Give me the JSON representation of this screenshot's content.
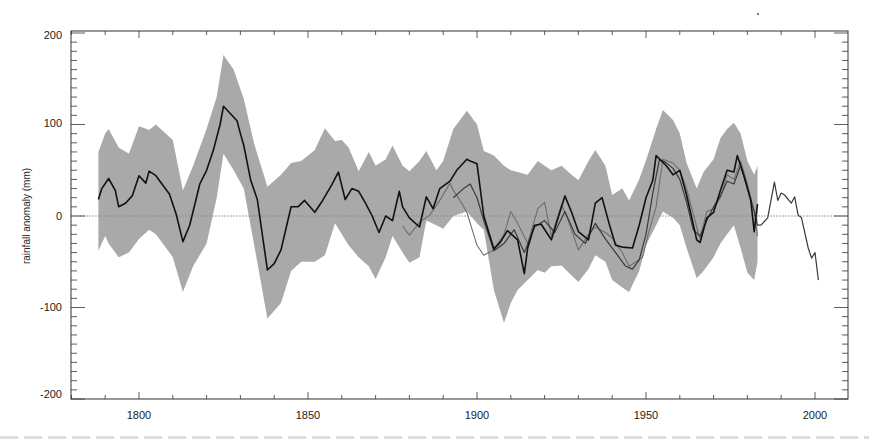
{
  "chart_data": {
    "type": "line",
    "title": "",
    "xlabel": "",
    "ylabel": "rainfall anomaly (mm)",
    "xlim": [
      1780,
      2010
    ],
    "ylim": [
      -200,
      200
    ],
    "x_ticks": [
      1800,
      1850,
      1900,
      1950,
      2000
    ],
    "y_ticks": [
      -200,
      -100,
      0,
      100,
      200
    ],
    "x_minor_step": 10,
    "y_minor_step": 10,
    "grid": false,
    "zero_line": true,
    "legend": null,
    "band": {
      "name": "uncertainty range",
      "color": "#a9a9a9",
      "x": [
        1788,
        1790,
        1791,
        1794,
        1797,
        1800,
        1803,
        1805,
        1810,
        1813,
        1816,
        1820,
        1823,
        1825,
        1828,
        1831,
        1834,
        1838,
        1842,
        1845,
        1848,
        1852,
        1855,
        1858,
        1860,
        1862,
        1865,
        1868,
        1870,
        1873,
        1875,
        1878,
        1880,
        1883,
        1885,
        1888,
        1890,
        1893,
        1897,
        1900,
        1902,
        1905,
        1908,
        1910,
        1912,
        1915,
        1918,
        1920,
        1922,
        1925,
        1928,
        1930,
        1933,
        1935,
        1938,
        1940,
        1943,
        1945,
        1948,
        1950,
        1953,
        1955,
        1958,
        1960,
        1962,
        1965,
        1967,
        1970,
        1972,
        1974,
        1976,
        1978,
        1980,
        1982,
        1983
      ],
      "upper": [
        70,
        90,
        95,
        75,
        68,
        98,
        94,
        100,
        83,
        28,
        55,
        95,
        130,
        176,
        160,
        128,
        80,
        32,
        45,
        58,
        60,
        72,
        96,
        82,
        83,
        75,
        49,
        70,
        55,
        62,
        77,
        55,
        49,
        60,
        71,
        50,
        60,
        95,
        115,
        100,
        71,
        66,
        55,
        50,
        48,
        45,
        60,
        55,
        50,
        55,
        45,
        39,
        60,
        72,
        55,
        23,
        30,
        17,
        40,
        61,
        95,
        116,
        105,
        90,
        58,
        30,
        48,
        62,
        85,
        95,
        102,
        90,
        60,
        45,
        55
      ],
      "lower": [
        -38,
        -22,
        -30,
        -45,
        -40,
        -25,
        -15,
        -20,
        -45,
        -83,
        -55,
        -30,
        20,
        68,
        50,
        30,
        -30,
        -112,
        -95,
        -60,
        -50,
        -50,
        -43,
        -8,
        -20,
        -32,
        -45,
        -55,
        -69,
        -45,
        -22,
        -40,
        -51,
        -45,
        -5,
        -10,
        -14,
        0,
        5,
        -8,
        -15,
        -81,
        -117,
        -95,
        -81,
        -70,
        -59,
        -62,
        -55,
        -54,
        -65,
        -72,
        -58,
        -43,
        -50,
        -70,
        -78,
        -83,
        -60,
        -32,
        -10,
        5,
        -2,
        -10,
        -35,
        -68,
        -60,
        -45,
        -30,
        -20,
        -10,
        -35,
        -62,
        -70,
        -50
      ]
    },
    "series": [
      {
        "name": "reconstruction",
        "color": "#111111",
        "width": 1.6,
        "x": [
          1788,
          1789,
          1791,
          1793,
          1794,
          1796,
          1798,
          1800,
          1802,
          1803,
          1805,
          1807,
          1809,
          1811,
          1813,
          1815,
          1818,
          1820,
          1822,
          1824,
          1825,
          1827,
          1829,
          1830,
          1831,
          1833,
          1835,
          1838,
          1840,
          1842,
          1845,
          1847,
          1849,
          1852,
          1854,
          1857,
          1859,
          1861,
          1863,
          1865,
          1867,
          1869,
          1871,
          1873,
          1875,
          1877,
          1878,
          1880,
          1883,
          1885,
          1887,
          1889,
          1892,
          1894,
          1897,
          1898,
          1900,
          1902,
          1905,
          1907,
          1909,
          1912,
          1914,
          1915,
          1917,
          1919,
          1922,
          1924,
          1926,
          1928,
          1930,
          1933,
          1935,
          1937,
          1939,
          1941,
          1943,
          1946,
          1948,
          1950,
          1952,
          1953,
          1956,
          1958,
          1960,
          1962,
          1965,
          1966,
          1968,
          1970,
          1972,
          1974,
          1976,
          1977,
          1979,
          1981,
          1982,
          1983
        ],
        "y": [
          18,
          30,
          41,
          28,
          10,
          14,
          22,
          44,
          36,
          49,
          44,
          34,
          24,
          2,
          -28,
          -10,
          35,
          50,
          72,
          100,
          120,
          112,
          104,
          90,
          77,
          40,
          18,
          -59,
          -52,
          -37,
          10,
          10,
          17,
          4,
          15,
          34,
          48,
          18,
          30,
          27,
          14,
          0,
          -18,
          0,
          -5,
          27,
          10,
          -2,
          -12,
          21,
          8,
          30,
          38,
          50,
          62,
          60,
          57,
          0,
          -36,
          -28,
          -16,
          -26,
          -63,
          -35,
          -10,
          -9,
          -26,
          -2,
          22,
          4,
          -17,
          -26,
          14,
          20,
          -7,
          -32,
          -34,
          -35,
          -10,
          20,
          39,
          66,
          55,
          45,
          50,
          23,
          -26,
          -29,
          -2,
          4,
          28,
          50,
          48,
          66,
          44,
          17,
          -17,
          13
        ]
      },
      {
        "name": "series 2",
        "color": "#6e6e6e",
        "width": 1.1,
        "x": [
          1878,
          1880,
          1883,
          1886,
          1889,
          1892,
          1893,
          1895,
          1897,
          1900,
          1902,
          1905,
          1908,
          1910,
          1912,
          1915,
          1918,
          1920,
          1922,
          1925,
          1927,
          1930,
          1933,
          1935,
          1938,
          1940,
          1943,
          1945,
          1947,
          1949,
          1951,
          1953,
          1955,
          1958,
          1960,
          1962,
          1965,
          1966,
          1968,
          1970,
          1972,
          1974,
          1976,
          1978,
          1980,
          1982,
          1983
        ],
        "y": [
          -11,
          -21,
          -7,
          1,
          17,
          36,
          28,
          17,
          4,
          -32,
          -43,
          -37,
          -20,
          5,
          -8,
          -30,
          8,
          15,
          -22,
          12,
          -5,
          -37,
          -20,
          -12,
          -18,
          -24,
          -40,
          -55,
          -50,
          -45,
          -15,
          10,
          62,
          58,
          50,
          30,
          -12,
          -25,
          5,
          8,
          20,
          45,
          40,
          60,
          35,
          5,
          -22
        ]
      },
      {
        "name": "series 3 (instrumental, extended)",
        "color": "#3a3a3a",
        "width": 1.2,
        "x": [
          1893,
          1896,
          1898,
          1900,
          1902,
          1905,
          1908,
          1911,
          1914,
          1917,
          1920,
          1923,
          1926,
          1929,
          1932,
          1935,
          1938,
          1941,
          1944,
          1946,
          1948,
          1950,
          1952,
          1954,
          1956,
          1958,
          1960,
          1962,
          1964,
          1966,
          1968,
          1970,
          1972,
          1974,
          1976,
          1978,
          1980,
          1982,
          1983,
          1984,
          1986,
          1988,
          1989,
          1990,
          1991,
          1993,
          1994,
          1995,
          1996,
          1998,
          1999,
          2000,
          2001
        ],
        "y": [
          20,
          30,
          35,
          20,
          -5,
          -38,
          -30,
          -15,
          -40,
          -12,
          -5,
          -18,
          5,
          -20,
          -30,
          -8,
          -25,
          -40,
          -55,
          -58,
          -48,
          -20,
          25,
          62,
          58,
          52,
          40,
          15,
          -15,
          -22,
          -5,
          10,
          22,
          38,
          35,
          55,
          30,
          5,
          -10,
          -10,
          -2,
          37,
          17,
          25,
          23,
          14,
          21,
          1,
          -2,
          -35,
          -46,
          -40,
          -70
        ]
      }
    ]
  },
  "axes": {
    "y_label": "rainfall anomaly (mm)",
    "y_tick_labels": [
      "200",
      "100",
      "0",
      "-100",
      "-200"
    ],
    "x_tick_labels": [
      "1800",
      "1850",
      "1900",
      "1950",
      "2000"
    ]
  }
}
